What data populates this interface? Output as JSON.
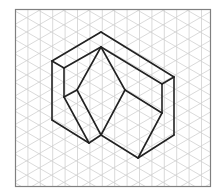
{
  "figure": {
    "type": "isometric-drawing",
    "frame": {
      "x": 15,
      "y": 9,
      "width": 196,
      "height": 178,
      "stroke": "#808080"
    },
    "grid": {
      "vertical_spacing": 12.4,
      "origin_x": 15.5,
      "line_color": "#d0d0d0",
      "angle_deg": 30
    },
    "shape": {
      "stroke": "#222222",
      "stroke_width": 1.6,
      "outline_edges": [
        [
          [
            52,
            61
          ],
          [
            101,
            32
          ]
        ],
        [
          [
            101,
            32
          ],
          [
            174,
            77
          ]
        ],
        [
          [
            174,
            77
          ],
          [
            174,
            135
          ]
        ],
        [
          [
            174,
            135
          ],
          [
            138,
            158
          ]
        ],
        [
          [
            138,
            158
          ],
          [
            101,
            135
          ]
        ],
        [
          [
            101,
            135
          ],
          [
            89,
            143
          ]
        ],
        [
          [
            89,
            143
          ],
          [
            52,
            120
          ]
        ],
        [
          [
            52,
            120
          ],
          [
            52,
            61
          ]
        ]
      ],
      "inner_edges": [
        [
          [
            52,
            61
          ],
          [
            64,
            68
          ]
        ],
        [
          [
            64,
            68
          ],
          [
            101,
            47
          ]
        ],
        [
          [
            101,
            47
          ],
          [
            162,
            84
          ]
        ],
        [
          [
            162,
            84
          ],
          [
            174,
            77
          ]
        ],
        [
          [
            64,
            68
          ],
          [
            64,
            97
          ]
        ],
        [
          [
            162,
            84
          ],
          [
            162,
            113
          ]
        ],
        [
          [
            64,
            97
          ],
          [
            77,
            90
          ]
        ],
        [
          [
            64,
            97
          ],
          [
            89,
            143
          ]
        ],
        [
          [
            77,
            90
          ],
          [
            101,
            47
          ]
        ],
        [
          [
            77,
            90
          ],
          [
            101,
            135
          ]
        ],
        [
          [
            101,
            47
          ],
          [
            125,
            90
          ]
        ],
        [
          [
            125,
            90
          ],
          [
            101,
            135
          ]
        ],
        [
          [
            125,
            90
          ],
          [
            162,
            113
          ]
        ],
        [
          [
            162,
            113
          ],
          [
            138,
            158
          ]
        ]
      ]
    }
  }
}
